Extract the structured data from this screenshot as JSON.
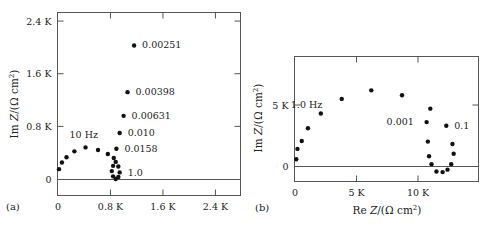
{
  "chart_data": [
    {
      "panel": "(a)",
      "type": "scatter",
      "title": "",
      "xlabel": "",
      "ylabel": "Im Z/(Ω cm²)",
      "xlim": [
        0,
        2800
      ],
      "ylim": [
        -240,
        2550
      ],
      "x_ticks": [
        "0",
        "0.8 K",
        "1.6 K",
        "2.4 K"
      ],
      "x_tick_values": [
        0,
        800,
        1600,
        2400
      ],
      "y_ticks": [
        "0",
        "0.8 K",
        "1.6 K",
        "2.4 K"
      ],
      "y_tick_values": [
        0,
        800,
        1600,
        2400
      ],
      "grid": false,
      "points": [
        {
          "x": 15,
          "y": 150
        },
        {
          "x": 60,
          "y": 250
        },
        {
          "x": 130,
          "y": 330
        },
        {
          "x": 250,
          "y": 420
        },
        {
          "x": 420,
          "y": 480
        },
        {
          "x": 610,
          "y": 440
        },
        {
          "x": 760,
          "y": 380
        },
        {
          "x": 850,
          "y": 320
        },
        {
          "x": 880,
          "y": 260
        },
        {
          "x": 920,
          "y": 190
        },
        {
          "x": 940,
          "y": 100
        },
        {
          "x": 920,
          "y": 30
        },
        {
          "x": 880,
          "y": 0
        },
        {
          "x": 840,
          "y": 40
        },
        {
          "x": 820,
          "y": 120
        },
        {
          "x": 840,
          "y": 200
        },
        {
          "x": 890,
          "y": 460
        },
        {
          "x": 940,
          "y": 700
        },
        {
          "x": 1000,
          "y": 960
        },
        {
          "x": 1060,
          "y": 1320
        },
        {
          "x": 1160,
          "y": 2030
        }
      ],
      "annotations": [
        {
          "text": "10 Hz",
          "x": 420,
          "y": 480
        },
        {
          "text": "1.0",
          "x": 940,
          "y": 100
        },
        {
          "text": "0.0158",
          "x": 890,
          "y": 460
        },
        {
          "text": "0.010",
          "x": 940,
          "y": 700
        },
        {
          "text": "0.00631",
          "x": 1000,
          "y": 960
        },
        {
          "text": "0.00398",
          "x": 1060,
          "y": 1320
        },
        {
          "text": "0.00251",
          "x": 1160,
          "y": 2030
        }
      ]
    },
    {
      "panel": "(b)",
      "type": "scatter",
      "title": "",
      "xlabel": "Re Z/(Ω cm²)",
      "ylabel": "Im Z/(Ω cm²)",
      "xlim": [
        0,
        14800
      ],
      "ylim": [
        -1200,
        9000
      ],
      "x_ticks": [
        "0",
        "5 K",
        "10 K"
      ],
      "x_tick_values": [
        0,
        5000,
        10000
      ],
      "y_ticks": [
        "0",
        "5 K"
      ],
      "y_tick_values": [
        0,
        5000
      ],
      "grid": false,
      "points": [
        {
          "x": 100,
          "y": 550
        },
        {
          "x": 200,
          "y": 1400
        },
        {
          "x": 550,
          "y": 2050
        },
        {
          "x": 1050,
          "y": 3100
        },
        {
          "x": 2100,
          "y": 4300
        },
        {
          "x": 3800,
          "y": 5500
        },
        {
          "x": 6200,
          "y": 6200
        },
        {
          "x": 8700,
          "y": 5800
        },
        {
          "x": 11000,
          "y": 4700
        },
        {
          "x": 10700,
          "y": 3600
        },
        {
          "x": 10800,
          "y": 2000
        },
        {
          "x": 10900,
          "y": 800
        },
        {
          "x": 11100,
          "y": 150
        },
        {
          "x": 11500,
          "y": -450
        },
        {
          "x": 12000,
          "y": -500
        },
        {
          "x": 12400,
          "y": -300
        },
        {
          "x": 12700,
          "y": 150
        },
        {
          "x": 12900,
          "y": 1000
        },
        {
          "x": 12800,
          "y": 1800
        },
        {
          "x": 12300,
          "y": 3300
        }
      ],
      "annotations": [
        {
          "text": "1.0 Hz",
          "x": 2100,
          "y": 4300
        },
        {
          "text": "0.001",
          "x": 10700,
          "y": 3600
        },
        {
          "text": "0.1",
          "x": 12300,
          "y": 3300
        }
      ]
    }
  ],
  "labels": {
    "panel_a": "(a)",
    "panel_b": "(b)",
    "ylabel_a": "Im Z/(Ω cm²)",
    "ylabel_b": "Im Z/(Ω cm²)",
    "xlabel_b": "Re Z/(Ω cm²)"
  }
}
